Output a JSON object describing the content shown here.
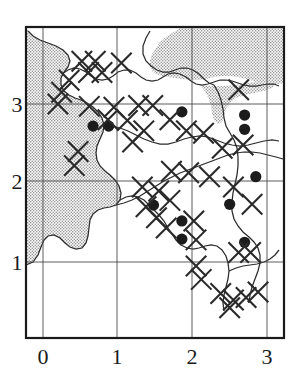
{
  "figure": {
    "title": "",
    "caption": "",
    "kind": "distribution-map"
  },
  "chart_data": {
    "type": "scatter",
    "title": "",
    "subtitle": "",
    "xlabel": "",
    "ylabel": "",
    "xlim": [
      -0.23,
      3.21
    ],
    "ylim": [
      0.0,
      4.09
    ],
    "grid": true,
    "legend_position": "none",
    "xticks": [
      0,
      1,
      2,
      3
    ],
    "xticklabels": [
      "0",
      "1",
      "2",
      "3"
    ],
    "yticks": [
      1,
      2,
      3
    ],
    "yticklabels": [
      "1",
      "2",
      "3"
    ],
    "series": [
      {
        "name": "filled-circle-records",
        "marker": "filled-circle",
        "color": "#1c1c1c",
        "count": 12,
        "points": [
          {
            "x": 0.67,
            "y": 2.72
          },
          {
            "x": 0.88,
            "y": 2.72
          },
          {
            "x": 1.86,
            "y": 2.9
          },
          {
            "x": 2.7,
            "y": 2.86
          },
          {
            "x": 2.7,
            "y": 2.68
          },
          {
            "x": 2.85,
            "y": 2.08
          },
          {
            "x": 1.48,
            "y": 1.72
          },
          {
            "x": 2.5,
            "y": 1.73
          },
          {
            "x": 1.86,
            "y": 1.52
          },
          {
            "x": 1.86,
            "y": 1.29
          },
          {
            "x": 2.7,
            "y": 1.25
          }
        ]
      },
      {
        "name": "cross-records",
        "marker": "x-cross",
        "color": "#2a2a2a",
        "count": 46,
        "points": [
          {
            "x": 0.52,
            "y": 3.54
          },
          {
            "x": 0.7,
            "y": 3.54
          },
          {
            "x": 0.61,
            "y": 3.4
          },
          {
            "x": 0.79,
            "y": 3.4
          },
          {
            "x": 1.05,
            "y": 3.52
          },
          {
            "x": 0.35,
            "y": 3.3
          },
          {
            "x": 0.25,
            "y": 3.15
          },
          {
            "x": 0.2,
            "y": 3.0
          },
          {
            "x": 0.62,
            "y": 2.97
          },
          {
            "x": 0.95,
            "y": 2.96
          },
          {
            "x": 1.28,
            "y": 2.98
          },
          {
            "x": 1.47,
            "y": 2.98
          },
          {
            "x": 0.87,
            "y": 2.8
          },
          {
            "x": 1.13,
            "y": 2.79
          },
          {
            "x": 1.35,
            "y": 2.66
          },
          {
            "x": 1.2,
            "y": 2.52
          },
          {
            "x": 1.7,
            "y": 2.8
          },
          {
            "x": 1.92,
            "y": 2.66
          },
          {
            "x": 2.15,
            "y": 2.63
          },
          {
            "x": 2.4,
            "y": 2.44
          },
          {
            "x": 2.68,
            "y": 2.48
          },
          {
            "x": 2.62,
            "y": 3.18
          },
          {
            "x": 1.72,
            "y": 2.15
          },
          {
            "x": 1.95,
            "y": 2.13
          },
          {
            "x": 2.23,
            "y": 2.08
          },
          {
            "x": 0.47,
            "y": 2.4
          },
          {
            "x": 0.42,
            "y": 2.22
          },
          {
            "x": 1.33,
            "y": 1.95
          },
          {
            "x": 1.55,
            "y": 1.9
          },
          {
            "x": 1.7,
            "y": 1.78
          },
          {
            "x": 1.38,
            "y": 1.7
          },
          {
            "x": 1.52,
            "y": 1.56
          },
          {
            "x": 1.65,
            "y": 1.43
          },
          {
            "x": 2.02,
            "y": 1.52
          },
          {
            "x": 2.05,
            "y": 1.28
          },
          {
            "x": 2.55,
            "y": 1.95
          },
          {
            "x": 2.8,
            "y": 1.73
          },
          {
            "x": 2.62,
            "y": 1.12
          },
          {
            "x": 2.78,
            "y": 1.12
          },
          {
            "x": 2.05,
            "y": 0.95
          },
          {
            "x": 2.12,
            "y": 0.78
          },
          {
            "x": 2.38,
            "y": 0.6
          },
          {
            "x": 2.55,
            "y": 0.52
          },
          {
            "x": 2.72,
            "y": 0.55
          },
          {
            "x": 2.88,
            "y": 0.62
          },
          {
            "x": 2.5,
            "y": 0.42
          }
        ]
      }
    ]
  },
  "axes": {
    "x_tick_labels": [
      "0",
      "1",
      "2",
      "3"
    ],
    "y_tick_labels": [
      "3",
      "2",
      "1"
    ]
  },
  "map_layers": {
    "sea_fill_label": "stippled-sea-area",
    "sea_fill_color": "#c9c9c9",
    "land_fill_color": "#ffffff",
    "coastline_color": "#2b2b2b",
    "border_color": "#1a1a1a",
    "grid_color": "#4a4a4a"
  }
}
